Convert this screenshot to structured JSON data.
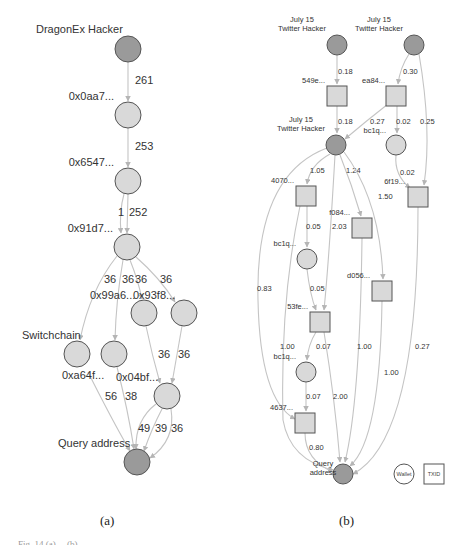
{
  "figure": {
    "panel_a_label": "(a)",
    "panel_b_label": "(b)",
    "caption_fragment": "Fig. 14 (a) ... (b) ..."
  },
  "colors": {
    "highlight_node": "#9a9a9a",
    "regular_node": "#d9d9d9",
    "node_stroke": "#555555",
    "edge": "#c4c4c4",
    "text": "#333333"
  },
  "panel_a": {
    "title": "DragonEx hacker fund flow",
    "nodes": [
      {
        "id": "a_hacker",
        "label": "DragonEx Hacker",
        "shape": "circle",
        "highlight": true,
        "x": 128,
        "y": 49,
        "r": 13,
        "lx": 36,
        "ly": 33,
        "anchor": "start"
      },
      {
        "id": "a_0aa7",
        "label": "0x0aa7...",
        "shape": "circle",
        "highlight": false,
        "x": 128,
        "y": 115,
        "r": 13,
        "lx": 114,
        "ly": 100,
        "anchor": "end"
      },
      {
        "id": "a_6547",
        "label": "0x6547...",
        "shape": "circle",
        "highlight": false,
        "x": 128,
        "y": 181,
        "r": 13,
        "lx": 114,
        "ly": 166,
        "anchor": "end"
      },
      {
        "id": "a_91d7",
        "label": "0x91d7...",
        "shape": "circle",
        "highlight": false,
        "x": 127,
        "y": 247,
        "r": 13,
        "lx": 113,
        "ly": 232,
        "anchor": "end"
      },
      {
        "id": "a_99a6",
        "label": "0x99a6...",
        "shape": "circle",
        "highlight": false,
        "x": 144,
        "y": 313,
        "r": 13,
        "lx": 90,
        "ly": 299,
        "anchor": "start"
      },
      {
        "id": "a_93f8",
        "label": "0x93f8...",
        "shape": "circle",
        "highlight": false,
        "x": 184,
        "y": 313,
        "r": 13,
        "lx": 133,
        "ly": 299,
        "anchor": "start"
      },
      {
        "id": "a_switchchain",
        "label": "Switchchain",
        "shape": "circle",
        "highlight": false,
        "x": 77,
        "y": 354,
        "r": 13,
        "lx": 22,
        "ly": 339,
        "anchor": "start"
      },
      {
        "id": "a_a64f",
        "label": "0xa64f...",
        "shape": "circle",
        "highlight": false,
        "x": 114,
        "y": 354,
        "r": 13,
        "lx": 62,
        "ly": 379,
        "anchor": "start"
      },
      {
        "id": "a_04bf",
        "label": "0x04bf...",
        "shape": "circle",
        "highlight": false,
        "x": 167,
        "y": 396,
        "r": 13,
        "lx": 116,
        "ly": 381,
        "anchor": "start"
      },
      {
        "id": "a_query",
        "label": "Query address",
        "shape": "circle",
        "highlight": true,
        "x": 137,
        "y": 462,
        "r": 13,
        "lx": 58,
        "ly": 447,
        "anchor": "start"
      }
    ],
    "edges": [
      {
        "from": "a_hacker",
        "to": "a_0aa7",
        "label": "261",
        "lx": 135,
        "ly": 84,
        "path": "M128,62 L128,101"
      },
      {
        "from": "a_0aa7",
        "to": "a_6547",
        "label": "253",
        "lx": 135,
        "ly": 150,
        "path": "M128,128 L128,167"
      },
      {
        "from": "a_6547",
        "to": "a_91d7",
        "label": "1",
        "lx": 118,
        "ly": 216,
        "path": "M124,194 Q119,212 121,233"
      },
      {
        "from": "a_6547",
        "to": "a_91d7",
        "label": "252",
        "lx": 129,
        "ly": 216,
        "path": "M128,194 L127,233"
      },
      {
        "from": "a_91d7",
        "to": "a_switchchain",
        "label": "36",
        "lx": 104,
        "ly": 283,
        "path": "M117,256 Q90,290 80,340"
      },
      {
        "from": "a_91d7",
        "to": "a_a64f",
        "label": "36",
        "lx": 122,
        "ly": 283,
        "path": "M123,260 Q116,300 115,340"
      },
      {
        "from": "a_91d7",
        "to": "a_99a6",
        "label": "36",
        "lx": 135,
        "ly": 283,
        "path": "M130,260 Q138,280 142,299"
      },
      {
        "from": "a_91d7",
        "to": "a_93f8",
        "label": "36",
        "lx": 160,
        "ly": 283,
        "path": "M136,257 Q160,278 175,302"
      },
      {
        "from": "a_99a6",
        "to": "a_04bf",
        "label": "36",
        "lx": 158,
        "ly": 358,
        "path": "M146,326 Q152,355 160,383"
      },
      {
        "from": "a_93f8",
        "to": "a_04bf",
        "label": "36",
        "lx": 178,
        "ly": 358,
        "path": "M182,326 Q177,355 172,383"
      },
      {
        "from": "a_switchchain",
        "to": "a_query",
        "label": "56",
        "lx": 105,
        "ly": 400,
        "path": "M88,372 Q112,420 130,451"
      },
      {
        "from": "a_a64f",
        "to": "a_query",
        "label": "38",
        "lx": 125,
        "ly": 400,
        "path": "M117,367 Q128,410 134,449"
      },
      {
        "from": "a_04bf",
        "to": "a_query",
        "label": "49",
        "lx": 138,
        "ly": 432,
        "path": "M156,404 Q135,420 136,449"
      },
      {
        "from": "a_04bf",
        "to": "a_query",
        "label": "39",
        "lx": 155,
        "ly": 432,
        "path": "M162,409 Q152,428 144,451"
      },
      {
        "from": "a_04bf",
        "to": "a_query",
        "label": "36",
        "lx": 171,
        "ly": 432,
        "path": "M171,409 Q176,440 150,458"
      }
    ]
  },
  "panel_b": {
    "title": "July 15 Twitter hacker fund flow",
    "nodes": [
      {
        "id": "b_hacker1",
        "label": "July 15\nTwitter Hacker",
        "shape": "circle",
        "highlight": true,
        "x": 337,
        "y": 45,
        "r": 10,
        "lx": 302,
        "ly": 22,
        "anchor": "middle",
        "lxc": 302
      },
      {
        "id": "b_hacker2",
        "label": "July 15\nTwitter Hacker",
        "shape": "circle",
        "highlight": true,
        "x": 414,
        "y": 45,
        "r": 10,
        "lx": 379,
        "ly": 22,
        "anchor": "middle",
        "lxc": 379
      },
      {
        "id": "b_549e",
        "label": "549e...",
        "shape": "square",
        "highlight": false,
        "x": 337,
        "y": 96,
        "r": 10,
        "lx": 325,
        "ly": 83,
        "anchor": "end"
      },
      {
        "id": "b_ea84",
        "label": "ea84...",
        "shape": "square",
        "highlight": false,
        "x": 396,
        "y": 96,
        "r": 10,
        "lx": 385,
        "ly": 83,
        "anchor": "end"
      },
      {
        "id": "b_hacker3",
        "label": "July 15\nTwitter Hacker",
        "shape": "circle",
        "highlight": true,
        "x": 336,
        "y": 145,
        "r": 10,
        "lx": 301,
        "ly": 122,
        "anchor": "middle",
        "lxc": 301
      },
      {
        "id": "b_bc1q_a",
        "label": "bc1q...",
        "shape": "circle",
        "highlight": false,
        "x": 396,
        "y": 145,
        "r": 10,
        "lx": 386,
        "ly": 133,
        "anchor": "end"
      },
      {
        "id": "b_4070",
        "label": "4070...",
        "shape": "square",
        "highlight": false,
        "x": 306,
        "y": 196,
        "r": 10,
        "lx": 294,
        "ly": 183,
        "anchor": "end"
      },
      {
        "id": "b_6f19",
        "label": "6f19...",
        "shape": "square",
        "highlight": false,
        "x": 418,
        "y": 197,
        "r": 10,
        "lx": 405,
        "ly": 184,
        "anchor": "end"
      },
      {
        "id": "b_f084",
        "label": "f084...",
        "shape": "square",
        "highlight": false,
        "x": 362,
        "y": 228,
        "r": 10,
        "lx": 350,
        "ly": 215,
        "anchor": "end"
      },
      {
        "id": "b_bc1q_b",
        "label": "bc1q...",
        "shape": "circle",
        "highlight": false,
        "x": 307,
        "y": 259,
        "r": 10,
        "lx": 296,
        "ly": 246,
        "anchor": "end"
      },
      {
        "id": "b_d056",
        "label": "d056...",
        "shape": "square",
        "highlight": false,
        "x": 382,
        "y": 291,
        "r": 10,
        "lx": 370,
        "ly": 278,
        "anchor": "end"
      },
      {
        "id": "b_53fe",
        "label": "53fe...",
        "shape": "square",
        "highlight": false,
        "x": 320,
        "y": 322,
        "r": 10,
        "lx": 308,
        "ly": 309,
        "anchor": "end"
      },
      {
        "id": "b_bc1q_c",
        "label": "bc1q...",
        "shape": "circle",
        "highlight": false,
        "x": 306,
        "y": 372,
        "r": 10,
        "lx": 296,
        "ly": 359,
        "anchor": "end"
      },
      {
        "id": "b_4637",
        "label": "4637...",
        "shape": "square",
        "highlight": false,
        "x": 305,
        "y": 423,
        "r": 10,
        "lx": 293,
        "ly": 410,
        "anchor": "end"
      },
      {
        "id": "b_query",
        "label": "Query\naddress",
        "shape": "circle",
        "highlight": true,
        "x": 343,
        "y": 474,
        "r": 10,
        "lx": 323,
        "ly": 466,
        "anchor": "middle",
        "lxc": 323
      }
    ],
    "edges": [
      {
        "label": "0.18",
        "lx": 338,
        "ly": 74,
        "path": "M337,55 L337,84"
      },
      {
        "label": "0.30",
        "lx": 403,
        "ly": 74,
        "path": "M409,54 Q400,68 398,84"
      },
      {
        "label": "0.25",
        "lx": 420,
        "ly": 124,
        "path": "M419,54 Q432,130 424,185"
      },
      {
        "label": "0.18",
        "lx": 338,
        "ly": 124,
        "path": "M337,106 L337,133"
      },
      {
        "label": "0.27",
        "lx": 370,
        "ly": 124,
        "path": "M388,104 Q365,122 345,139"
      },
      {
        "label": "0.02",
        "lx": 396,
        "ly": 124,
        "path": "M397,106 L397,133"
      },
      {
        "label": "0.02",
        "lx": 400,
        "ly": 175,
        "path": "M396,155 Q394,175 410,188"
      },
      {
        "label": "1.05",
        "lx": 310,
        "ly": 173,
        "path": "M330,154 Q310,165 307,184"
      },
      {
        "label": "1.24",
        "lx": 346,
        "ly": 173,
        "path": "M340,155 Q352,185 361,216"
      },
      {
        "label": "1.50",
        "lx": 378,
        "ly": 199,
        "path": "M344,152 Q380,200 383,279"
      },
      {
        "label": "0.05",
        "lx": 306,
        "ly": 229,
        "path": "M307,206 L307,247"
      },
      {
        "label": "2.03",
        "lx": 332,
        "ly": 229,
        "path": "M335,155 Q329,260 324,310"
      },
      {
        "label": "0.83",
        "lx": 257,
        "ly": 291,
        "path": "M327,148 Q255,175 258,300 Q260,400 295,419"
      },
      {
        "label": "0.05",
        "lx": 310,
        "ly": 291,
        "path": "M307,269 Q310,295 316,310"
      },
      {
        "label": "1.00",
        "lx": 280,
        "ly": 349,
        "path": "M300,206 Q280,300 283,420 Q290,460 333,470"
      },
      {
        "label": "0.07",
        "lx": 316,
        "ly": 349,
        "path": "M316,332 Q308,345 307,360"
      },
      {
        "label": "1.00",
        "lx": 357,
        "ly": 349,
        "path": "M362,238 Q360,400 345,462"
      },
      {
        "label": "1.00",
        "lx": 384,
        "ly": 375,
        "path": "M382,301 Q380,440 350,466"
      },
      {
        "label": "0.27",
        "lx": 415,
        "ly": 349,
        "path": "M418,207 Q418,440 353,474"
      },
      {
        "label": "0.07",
        "lx": 306,
        "ly": 399,
        "path": "M306,382 L306,411"
      },
      {
        "label": "2.00",
        "lx": 333,
        "ly": 399,
        "path": "M324,332 Q335,400 340,462"
      },
      {
        "label": "0.80",
        "lx": 309,
        "ly": 450,
        "path": "M305,433 Q305,460 333,472"
      }
    ],
    "legend": [
      {
        "shape": "circle",
        "label": "Wallet",
        "x": 404,
        "y": 474
      },
      {
        "shape": "square",
        "label": "TXID",
        "x": 434,
        "y": 474
      }
    ]
  }
}
